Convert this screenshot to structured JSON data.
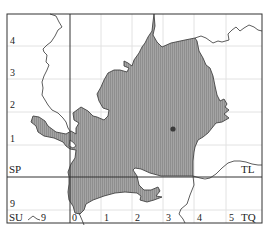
{
  "map": {
    "grid_squares": {
      "top_left": "SP",
      "top_right": "TL",
      "bottom_left": "SU",
      "bottom_right": "TQ"
    },
    "northing_labels": [
      "4",
      "3",
      "2",
      "1",
      "9"
    ],
    "easting_labels": [
      "9",
      "0",
      "1",
      "2",
      "3",
      "4",
      "5"
    ],
    "colors": {
      "region_fill": "#9a9a9a",
      "region_stroke": "#444444",
      "grid_major": "#333333",
      "grid_minor": "#e2e2e2",
      "boundary": "#333333",
      "dot": "#3a3a3a",
      "background": "#ffffff"
    },
    "record_dot": {
      "x": 173,
      "y": 129
    }
  }
}
